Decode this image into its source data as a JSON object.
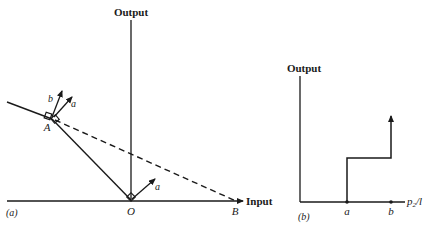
{
  "panel_a": {
    "label": "(a)",
    "y_axis_label": "Output",
    "x_axis_label": "Input",
    "points": {
      "O": "O",
      "A": "A",
      "B": "B"
    },
    "vector_at_O": "a",
    "vectors_at_A": [
      "b",
      "a"
    ]
  },
  "panel_b": {
    "label": "(b)",
    "y_axis_label": "Output",
    "x_axis_label_main": "p",
    "x_axis_label_sub": "2",
    "x_axis_label_tail": "/l",
    "ticks": [
      "a",
      "b"
    ]
  },
  "colors": {
    "ink": "#1a1a1a",
    "background": "#ffffff"
  }
}
